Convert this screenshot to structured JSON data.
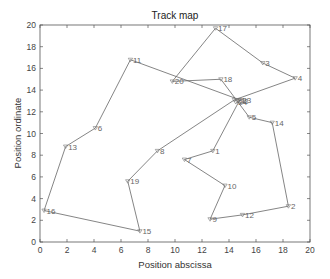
{
  "chart_data": {
    "type": "line",
    "title": "Track map",
    "xlabel": "Position abscissa",
    "ylabel": "Position ordinate",
    "xlim": [
      0,
      20
    ],
    "ylim": [
      0,
      20
    ],
    "xticks": [
      0,
      2,
      4,
      6,
      8,
      10,
      12,
      14,
      16,
      18,
      20
    ],
    "yticks": [
      0,
      2,
      4,
      6,
      8,
      10,
      12,
      14,
      16,
      18,
      20
    ],
    "grid": false,
    "legend": null,
    "points": [
      {
        "id": "1",
        "x": 12.8,
        "y": 8.4
      },
      {
        "id": "2",
        "x": 18.4,
        "y": 3.3
      },
      {
        "id": "3",
        "x": 16.5,
        "y": 16.5
      },
      {
        "id": "4",
        "x": 18.9,
        "y": 15.1
      },
      {
        "id": "5",
        "x": 15.5,
        "y": 11.5
      },
      {
        "id": "6",
        "x": 4.1,
        "y": 10.5
      },
      {
        "id": "7",
        "x": 10.7,
        "y": 7.6
      },
      {
        "id": "8",
        "x": 8.7,
        "y": 8.4
      },
      {
        "id": "9",
        "x": 12.6,
        "y": 2.1
      },
      {
        "id": "10",
        "x": 13.7,
        "y": 5.2
      },
      {
        "id": "11",
        "x": 6.7,
        "y": 16.8
      },
      {
        "id": "12",
        "x": 15.0,
        "y": 2.5
      },
      {
        "id": "13",
        "x": 1.9,
        "y": 8.8
      },
      {
        "id": "14",
        "x": 17.2,
        "y": 11.0
      },
      {
        "id": "15",
        "x": 7.4,
        "y": 1.0
      },
      {
        "id": "16",
        "x": 0.3,
        "y": 2.9
      },
      {
        "id": "17",
        "x": 13.0,
        "y": 19.7
      },
      {
        "id": "18",
        "x": 13.4,
        "y": 15.0
      },
      {
        "id": "19",
        "x": 6.5,
        "y": 5.6
      },
      {
        "id": "20",
        "x": 9.8,
        "y": 14.8
      },
      {
        "id": "21",
        "x": 14.4,
        "y": 13.1
      },
      {
        "id": "22",
        "x": 14.6,
        "y": 13.0
      },
      {
        "id": "23",
        "x": 14.8,
        "y": 13.1
      },
      {
        "id": "24",
        "x": 14.5,
        "y": 12.9
      }
    ],
    "path_order": [
      "16",
      "15",
      "19",
      "8",
      "21",
      "4",
      "3",
      "17",
      "20",
      "18",
      "22",
      "5",
      "14",
      "2",
      "12",
      "9",
      "10",
      "7",
      "1",
      "23",
      "11",
      "6",
      "13",
      "16"
    ]
  }
}
